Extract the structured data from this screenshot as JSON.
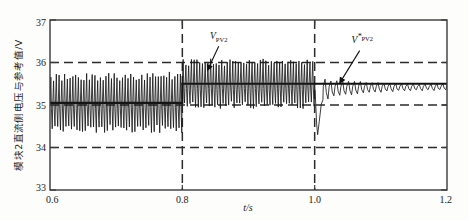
{
  "chart_data": {
    "type": "line",
    "title": "",
    "xlabel": "t/s",
    "ylabel": "模块2直流侧电压与参考值/V",
    "xlim": [
      0.6,
      1.2
    ],
    "ylim": [
      33,
      37
    ],
    "xticks": [
      "0.6",
      "0.8",
      "1.0",
      "1.2"
    ],
    "xtick_values": [
      0.6,
      0.8,
      1.0,
      1.2
    ],
    "yticks": [
      "33",
      "34",
      "35",
      "36",
      "37"
    ],
    "ytick_values": [
      33,
      34,
      35,
      36,
      37
    ],
    "grid": "dashed-horizontal-and-vertical",
    "gridlines_y": [
      34,
      35,
      36
    ],
    "gridlines_x": [
      0.8,
      1.0
    ],
    "legend_position": "inline-annotations",
    "annotations": [
      {
        "id": "vpv2",
        "symbol": "V",
        "subscript": "PV2",
        "superscript": "",
        "text": "V_PV2",
        "label_x": 0.855,
        "label_y": 36.55,
        "arrow_from_x": 0.855,
        "arrow_from_y": 36.38,
        "arrow_to_x": 0.838,
        "arrow_to_y": 35.82
      },
      {
        "id": "vpv2-ref",
        "symbol": "V",
        "subscript": "PV2",
        "superscript": "*",
        "text": "V*_PV2",
        "label_x": 1.072,
        "label_y": 36.46,
        "arrow_from_x": 1.068,
        "arrow_from_y": 36.28,
        "arrow_to_x": 1.038,
        "arrow_to_y": 35.52
      }
    ],
    "series": [
      {
        "name": "V_PV2_reference",
        "role": "reference",
        "style": "solid-thick",
        "color": "#111111",
        "description": "Stepped reference: 35.05 V from 0.6 s to 0.8 s, then 35.5 V from 0.8 s to 1.2 s",
        "segments": [
          {
            "x_start": 0.6,
            "x_end": 0.8,
            "value": 35.05
          },
          {
            "x_start": 0.8,
            "x_end": 1.2,
            "value": 35.5
          }
        ]
      },
      {
        "name": "V_PV2_measured",
        "role": "measured",
        "style": "solid-thin-oscillatory",
        "color": "#1a1a1a",
        "description": "Measured DC-side voltage of module 2 with switching ripple; high-ripple regimes before 1.0 s, transient dip then damped ripple after 1.0 s",
        "regimes": [
          {
            "x_start": 0.6,
            "x_end": 0.8,
            "mean": 35.05,
            "ripple_up": 0.62,
            "ripple_down": 0.62,
            "ripple_period_s": 0.0042
          },
          {
            "x_start": 0.8,
            "x_end": 1.0,
            "mean": 35.5,
            "ripple_up": 0.5,
            "ripple_down": 0.5,
            "ripple_period_s": 0.0042
          },
          {
            "x_start": 1.0,
            "x_end": 1.013,
            "mean": 35.5,
            "event": "transient-dip",
            "min": 34.3
          },
          {
            "x_start": 1.013,
            "x_end": 1.2,
            "mean": 35.48,
            "ripple_up": 0.12,
            "ripple_down": 0.12,
            "ripple_period_s": 0.0095,
            "damping": "decaying-envelope"
          }
        ],
        "key_points": [
          {
            "x": 0.6,
            "y": 35.05
          },
          {
            "x": 0.8,
            "y": 35.05
          },
          {
            "x": 0.8,
            "y": 35.5
          },
          {
            "x": 1.0,
            "y": 35.5
          },
          {
            "x": 1.004,
            "y": 34.3
          },
          {
            "x": 1.02,
            "y": 35.1
          },
          {
            "x": 1.06,
            "y": 35.35
          },
          {
            "x": 1.12,
            "y": 35.45
          },
          {
            "x": 1.2,
            "y": 35.48
          }
        ]
      }
    ]
  },
  "figure": {
    "background_color": "#fdfdfc",
    "axis_color": "#3a3a3a",
    "grid_color": "#2b2b2b",
    "trace_color": "#1a1a1a"
  }
}
